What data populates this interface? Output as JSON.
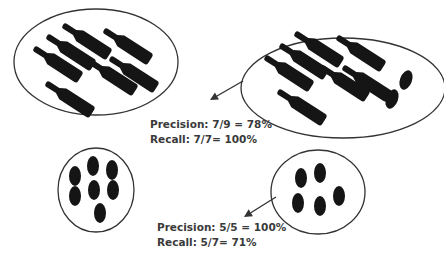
{
  "colors": {
    "background": "#ffffff",
    "outline": "#333333",
    "item": "#151515",
    "text": "#3a3a3a"
  },
  "clusters": [
    {
      "id": "true-bottles",
      "description": "Ground-truth cluster of bottles",
      "shape": {
        "cx": 96,
        "cy": 62,
        "rx": 82,
        "ry": 53
      },
      "bottles": [
        {
          "x": 63,
          "y": 25,
          "angle": 33
        },
        {
          "x": 47,
          "y": 36,
          "angle": 33
        },
        {
          "x": 34,
          "y": 48,
          "angle": 33
        },
        {
          "x": 104,
          "y": 30,
          "angle": 33
        },
        {
          "x": 89,
          "y": 61,
          "angle": 33
        },
        {
          "x": 110,
          "y": 58,
          "angle": 33
        },
        {
          "x": 46,
          "y": 83,
          "angle": 33
        }
      ],
      "olives": []
    },
    {
      "id": "predicted-bottles",
      "description": "Predicted cluster of bottles, including 2 misclassified olives",
      "shape": {
        "cx": 343,
        "cy": 88,
        "rx": 102,
        "ry": 50
      },
      "bottles": [
        {
          "x": 295,
          "y": 33,
          "angle": 33
        },
        {
          "x": 280,
          "y": 45,
          "angle": 33
        },
        {
          "x": 265,
          "y": 57,
          "angle": 33
        },
        {
          "x": 337,
          "y": 37,
          "angle": 33
        },
        {
          "x": 321,
          "y": 67,
          "angle": 33
        },
        {
          "x": 343,
          "y": 67,
          "angle": 33
        },
        {
          "x": 278,
          "y": 91,
          "angle": 33
        }
      ],
      "olives": [
        {
          "cx": 406,
          "cy": 80,
          "rx": 6,
          "ry": 10,
          "angle": 20
        },
        {
          "cx": 392,
          "cy": 99,
          "rx": 6,
          "ry": 10,
          "angle": 20
        }
      ]
    },
    {
      "id": "true-olives",
      "description": "Ground-truth cluster of olives",
      "shape": {
        "cx": 96,
        "cy": 190,
        "rx": 38,
        "ry": 42
      },
      "bottles": [],
      "olives": [
        {
          "cx": 75,
          "cy": 176,
          "rx": 6,
          "ry": 10,
          "angle": 0
        },
        {
          "cx": 75,
          "cy": 196,
          "rx": 6,
          "ry": 10,
          "angle": 0
        },
        {
          "cx": 93,
          "cy": 166,
          "rx": 6,
          "ry": 10,
          "angle": 0
        },
        {
          "cx": 112,
          "cy": 170,
          "rx": 6,
          "ry": 10,
          "angle": 0
        },
        {
          "cx": 94,
          "cy": 190,
          "rx": 6,
          "ry": 10,
          "angle": 0
        },
        {
          "cx": 113,
          "cy": 190,
          "rx": 6,
          "ry": 10,
          "angle": 0
        },
        {
          "cx": 100,
          "cy": 213,
          "rx": 6,
          "ry": 10,
          "angle": 0
        }
      ]
    },
    {
      "id": "predicted-olives",
      "description": "Predicted cluster of olives",
      "shape": {
        "cx": 318,
        "cy": 192,
        "rx": 47,
        "ry": 42
      },
      "bottles": [],
      "olives": [
        {
          "cx": 301,
          "cy": 178,
          "rx": 6,
          "ry": 10,
          "angle": 0
        },
        {
          "cx": 320,
          "cy": 173,
          "rx": 6,
          "ry": 10,
          "angle": 0
        },
        {
          "cx": 298,
          "cy": 203,
          "rx": 6,
          "ry": 10,
          "angle": 0
        },
        {
          "cx": 320,
          "cy": 206,
          "rx": 6,
          "ry": 10,
          "angle": 0
        },
        {
          "cx": 339,
          "cy": 196,
          "rx": 6,
          "ry": 10,
          "angle": 0
        }
      ]
    }
  ],
  "arrows": [
    {
      "id": "arrow-bottles",
      "x1": 243,
      "y1": 81,
      "x2": 210,
      "y2": 100
    },
    {
      "id": "arrow-olives",
      "x1": 276,
      "y1": 197,
      "x2": 244,
      "y2": 217
    }
  ],
  "metrics": {
    "bottles": {
      "precision_label": "Precision: 7/9 = 78%",
      "recall_label": "Recall: 7/7= 100%",
      "x": 150,
      "y1": 128,
      "y2": 143
    },
    "olives": {
      "precision_label": "Precision: 5/5 = 100%",
      "recall_label": "Recall: 5/7= 71%",
      "x": 157,
      "y1": 231,
      "y2": 246
    }
  }
}
